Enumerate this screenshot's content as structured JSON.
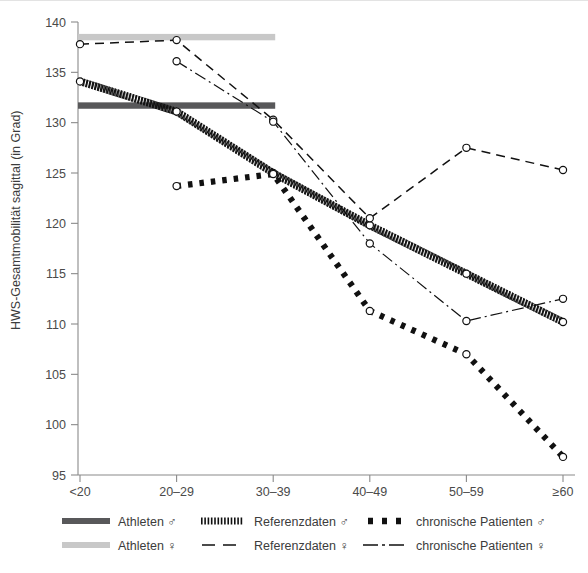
{
  "chart_data": {
    "type": "line",
    "title": "",
    "xlabel": "",
    "ylabel": "HWS-Gesamtmobilität sagittal (in Grad)",
    "categories": [
      "<20",
      "20–29",
      "30–39",
      "40–49",
      "50–59",
      "≥60"
    ],
    "ylim": [
      95,
      140
    ],
    "yticks": [
      95,
      100,
      105,
      110,
      115,
      120,
      125,
      130,
      135,
      140
    ],
    "ytick_labels": [
      "95",
      "100",
      "105",
      "110",
      "115",
      "120",
      "125",
      "130",
      "135",
      "140"
    ],
    "grid": false,
    "legend_position": "below",
    "series": [
      {
        "name": "Athleten ♂",
        "style": "thick-solid-band",
        "color": "#58585a",
        "constant_value": 131.7,
        "span_categories": [
          "<20",
          "30–39"
        ],
        "values": [
          131.7,
          131.7,
          131.7,
          null,
          null,
          null
        ],
        "markers": false
      },
      {
        "name": "Athleten ♀",
        "style": "thick-solid-band",
        "color": "#c8c8c8",
        "constant_value": 138.5,
        "span_categories": [
          "<20",
          "30–39"
        ],
        "values": [
          138.5,
          138.5,
          138.5,
          null,
          null,
          null
        ],
        "markers": false
      },
      {
        "name": "Referenzdaten ♂",
        "style": "hatched-thick",
        "color": "#111111",
        "values": [
          134.1,
          131.1,
          125.0,
          119.8,
          115.0,
          110.2
        ],
        "markers": true
      },
      {
        "name": "Referenzdaten ♀",
        "style": "dashed",
        "color": "#111111",
        "values": [
          137.8,
          138.2,
          130.3,
          120.5,
          127.5,
          125.3
        ],
        "markers": true
      },
      {
        "name": "chronische Patienten ♂",
        "style": "thick-dotted",
        "color": "#111111",
        "values": [
          null,
          123.7,
          124.9,
          111.3,
          107.0,
          96.8
        ],
        "markers": true
      },
      {
        "name": "chronische Patienten ♀",
        "style": "dash-dot",
        "color": "#111111",
        "values": [
          null,
          136.1,
          130.1,
          118.0,
          110.3,
          112.5
        ],
        "markers": true
      }
    ]
  },
  "legend": {
    "rows": [
      [
        {
          "label": "Athleten ♂",
          "swatch": "solid-dark-bar"
        },
        {
          "label": "Referenzdaten ♂",
          "swatch": "hatched-bar"
        },
        {
          "label": "chronische Patienten ♂",
          "swatch": "thick-dotted-bar"
        }
      ],
      [
        {
          "label": "Athleten ♀",
          "swatch": "solid-light-bar"
        },
        {
          "label": "Referenzdaten ♀",
          "swatch": "dashed-bar"
        },
        {
          "label": "chronische Patienten ♀",
          "swatch": "dash-dot-bar"
        }
      ]
    ]
  },
  "colors": {
    "athlete_male_bar": "#58585a",
    "athlete_female_bar": "#c8c8c8",
    "line": "#111111",
    "axis": "#8a8a8a",
    "text": "#3c3c3c",
    "background": "#ffffff"
  }
}
